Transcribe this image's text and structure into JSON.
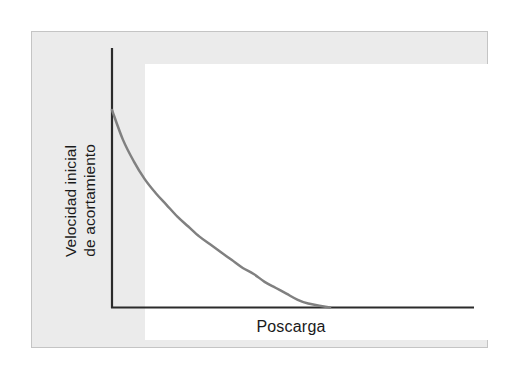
{
  "figure": {
    "background_color": "#ffffff",
    "panel": {
      "background_color": "#ebebeb",
      "border_color": "#c4c4c4",
      "plot_field_color": "#ffffff"
    }
  },
  "axes": {
    "y_label_line1": "Velocidad inicial",
    "y_label_line2": "de acortamiento",
    "x_label": "Poscarga",
    "axis_color": "#2b2b2b"
  },
  "chart_data": {
    "type": "line",
    "title": "",
    "subtitle": "",
    "xlabel": "Poscarga",
    "ylabel": "Velocidad inicial de acortamiento",
    "xlim": [
      0,
      1
    ],
    "ylim": [
      0,
      1
    ],
    "grid": false,
    "legend": null,
    "legend_position": "none",
    "tick_labels_x": [],
    "tick_labels_y": [],
    "annotations": [],
    "series": [
      {
        "name": "Relación fuerza-velocidad",
        "color": "#808080",
        "line_width": 2.5,
        "x": [
          0.0,
          0.05,
          0.1,
          0.15,
          0.2,
          0.25,
          0.3,
          0.35,
          0.4,
          0.45,
          0.5,
          0.55,
          0.6,
          0.65,
          0.7,
          0.75,
          0.8,
          0.85,
          0.9,
          1.0
        ],
        "y": [
          1.0,
          0.85,
          0.74,
          0.65,
          0.58,
          0.52,
          0.46,
          0.41,
          0.36,
          0.32,
          0.28,
          0.24,
          0.2,
          0.17,
          0.13,
          0.1,
          0.07,
          0.04,
          0.02,
          0.0
        ]
      }
    ]
  }
}
